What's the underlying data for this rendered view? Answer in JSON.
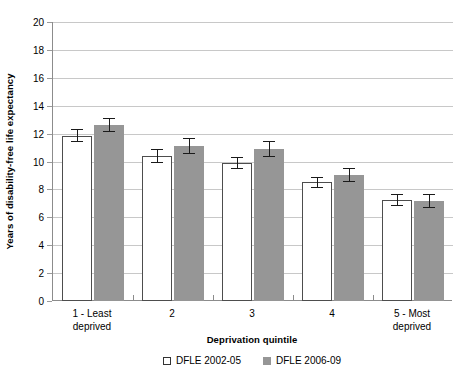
{
  "chart_data": {
    "type": "bar",
    "title": "",
    "xlabel": "Deprivation quintile",
    "ylabel": "Years of disability-free life expectancy",
    "categories": [
      "1 - Least\ndeprived",
      "2",
      "3",
      "4",
      "5 - Most\ndeprived"
    ],
    "ylim": [
      0,
      20
    ],
    "ytick_step": 2,
    "yticks": [
      0,
      2,
      4,
      6,
      8,
      10,
      12,
      14,
      16,
      18,
      20
    ],
    "grid": true,
    "legend_position": "bottom",
    "series": [
      {
        "name": "DFLE 2002-05",
        "style": "open",
        "color": "#ffffff",
        "edge_color": "#4d4d4d",
        "values": [
          11.85,
          10.4,
          9.9,
          8.5,
          7.25
        ],
        "errors": [
          0.45,
          0.5,
          0.45,
          0.4,
          0.45
        ]
      },
      {
        "name": "DFLE 2006-09",
        "style": "filled",
        "color": "#969696",
        "edge_color": "#969696",
        "values": [
          12.6,
          11.1,
          10.9,
          9.05,
          7.15
        ],
        "errors": [
          0.5,
          0.55,
          0.55,
          0.5,
          0.5
        ]
      }
    ]
  },
  "legend": {
    "items": [
      {
        "label": "DFLE 2002-05",
        "style": "open"
      },
      {
        "label": "DFLE 2006-09",
        "style": "filled"
      }
    ]
  },
  "colors": {
    "series_open_fill": "#ffffff",
    "series_open_edge": "#4d4d4d",
    "series_filled_fill": "#969696",
    "gridline": "#c8c8c8",
    "axis": "#8c8c8c",
    "error_bar": "#1a1a1a",
    "text": "#000000"
  }
}
